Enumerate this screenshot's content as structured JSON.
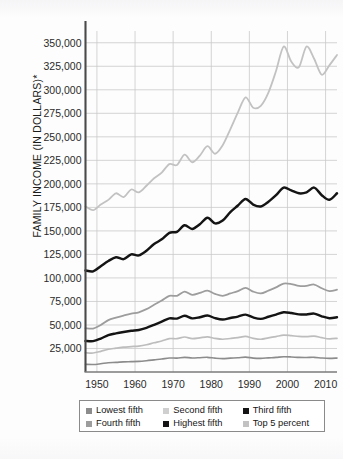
{
  "figure": {
    "background": "#fdfdfd",
    "axis_color": "#555555",
    "grid_color": "#c9c9c9"
  },
  "chart_data": {
    "type": "line",
    "title": "",
    "xlabel": "",
    "ylabel": "FAMILY INCOME (IN DOLLARS)*",
    "xlim": [
      1947,
      2013
    ],
    "ylim": [
      0,
      362500
    ],
    "grid": true,
    "legend_position": "below-axes",
    "ytick_labels": [
      "25,000",
      "50,000",
      "75,000",
      "100,000",
      "125,000",
      "150,000",
      "175,000",
      "200,000",
      "225,000",
      "250,000",
      "275,000",
      "300,000",
      "325,000",
      "350,000"
    ],
    "ytick_values": [
      25000,
      50000,
      75000,
      100000,
      125000,
      150000,
      175000,
      200000,
      225000,
      250000,
      275000,
      300000,
      325000,
      350000
    ],
    "xtick_labels": [
      "1950",
      "1960",
      "1970",
      "1980",
      "1990",
      "2000",
      "2010"
    ],
    "xtick_values": [
      1950,
      1960,
      1970,
      1980,
      1990,
      2000,
      2010
    ],
    "x": [
      1947,
      1949,
      1951,
      1953,
      1955,
      1957,
      1959,
      1961,
      1963,
      1965,
      1967,
      1969,
      1971,
      1973,
      1975,
      1977,
      1979,
      1981,
      1983,
      1985,
      1987,
      1989,
      1991,
      1993,
      1995,
      1997,
      1999,
      2001,
      2003,
      2005,
      2007,
      2009,
      2011,
      2013
    ],
    "series": [
      {
        "name": "Lowest fifth",
        "color": "#8c8c8c",
        "width": 1.6,
        "values": [
          8200,
          8000,
          8800,
          9800,
          10200,
          10800,
          11000,
          11300,
          12000,
          12900,
          13800,
          14900,
          14800,
          15600,
          14900,
          15200,
          15600,
          14700,
          14200,
          14700,
          15100,
          15800,
          14800,
          14500,
          15000,
          15500,
          16200,
          16000,
          15500,
          15400,
          15600,
          14900,
          14500,
          14800
        ]
      },
      {
        "name": "Second fifth",
        "color": "#bdbdbd",
        "width": 1.7,
        "values": [
          20500,
          20200,
          22000,
          24200,
          25300,
          26400,
          27000,
          27600,
          29000,
          31100,
          33000,
          35500,
          35400,
          37200,
          35500,
          36300,
          37400,
          35700,
          34800,
          35600,
          36500,
          37800,
          35800,
          34800,
          36300,
          37700,
          39200,
          38600,
          37800,
          37600,
          38200,
          36500,
          35200,
          35800
        ]
      },
      {
        "name": "Third fifth",
        "color": "#141414",
        "width": 2.4,
        "values": [
          33000,
          32800,
          35500,
          39200,
          41000,
          42500,
          43800,
          44700,
          47000,
          50200,
          53500,
          57000,
          56800,
          59800,
          57000,
          58200,
          60000,
          57300,
          55800,
          57400,
          58900,
          61000,
          58000,
          56500,
          58700,
          61000,
          63500,
          62700,
          61300,
          61200,
          62100,
          59200,
          57200,
          58200
        ]
      },
      {
        "name": "Fourth fifth",
        "color": "#9d9d9d",
        "width": 1.8,
        "values": [
          46500,
          46200,
          50000,
          55200,
          57800,
          60000,
          62000,
          63500,
          66800,
          71500,
          76000,
          81000,
          81000,
          85500,
          82000,
          84000,
          86500,
          83000,
          81000,
          83500,
          86000,
          89500,
          85500,
          83500,
          86500,
          90000,
          94000,
          93500,
          91500,
          91500,
          93000,
          89000,
          86000,
          87500
        ]
      },
      {
        "name": "Highest fifth",
        "color": "#141414",
        "width": 2.5,
        "values": [
          108000,
          107000,
          112500,
          118000,
          122000,
          120000,
          125000,
          124000,
          129000,
          136000,
          141000,
          148000,
          149000,
          156000,
          152000,
          157000,
          164000,
          158000,
          161000,
          170000,
          177000,
          184000,
          178000,
          176000,
          181000,
          188000,
          196000,
          193000,
          190000,
          191000,
          196000,
          188000,
          183000,
          190000
        ]
      },
      {
        "name": "Top 5 percent",
        "color": "#c2c2c2",
        "width": 1.8,
        "values": [
          176000,
          172000,
          178000,
          183000,
          190000,
          186000,
          194000,
          191000,
          198000,
          206000,
          212000,
          221000,
          220000,
          231000,
          223000,
          230000,
          240000,
          232000,
          241000,
          258000,
          276000,
          292000,
          281000,
          283000,
          297000,
          320000,
          346000,
          330000,
          324000,
          346000,
          333000,
          316000,
          326000,
          337000
        ]
      }
    ]
  },
  "legend": {
    "rows": [
      [
        {
          "label": "Lowest fifth",
          "color": "#8c8c8c"
        },
        {
          "label": "Second fifth",
          "color": "#cfcfcf"
        },
        {
          "label": "Third fifth",
          "color": "#141414"
        }
      ],
      [
        {
          "label": "Fourth fifth",
          "color": "#9d9d9d"
        },
        {
          "label": "Highest fifth",
          "color": "#141414"
        },
        {
          "label": "Top 5 percent",
          "color": "#c2c2c2"
        }
      ]
    ]
  }
}
